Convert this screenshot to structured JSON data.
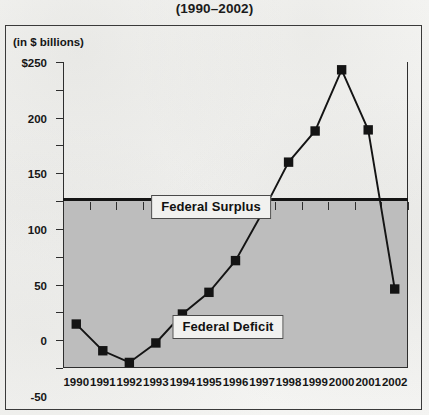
{
  "title": "(1990–2002)",
  "axis_unit_label": "(in $ billions)",
  "region_labels": {
    "surplus": "Federal Surplus",
    "deficit": "Federal Deficit"
  },
  "colors": {
    "line": "#141414",
    "marker": "#141414",
    "deficit_shading": "#bdbdbd",
    "axis": "#2e2e2e",
    "zero_line": "#141414",
    "paper_background": "#f2f2f0",
    "text": "#161616"
  },
  "chart_data": {
    "type": "line",
    "title": "(1990–2002)",
    "xlabel": "",
    "ylabel": "(in $ billions)",
    "ylim": [
      -300,
      250
    ],
    "grid": false,
    "legend": "none",
    "y_ticks": [
      250,
      200,
      150,
      100,
      50,
      0,
      -50,
      -100,
      -150,
      -200,
      -250,
      -300
    ],
    "y_tick_labels": [
      "$250",
      "200",
      "150",
      "100",
      "50",
      "0",
      "-50",
      "-100",
      "-150",
      "-200",
      "-250",
      "-300"
    ],
    "categories": [
      "1990",
      "1991",
      "1992",
      "1993",
      "1994",
      "1995",
      "1996",
      "1997",
      "1998",
      "1999",
      "2000",
      "2001",
      "2002"
    ],
    "values": [
      -221,
      -269,
      -290,
      -255,
      -203,
      -164,
      -107,
      -22,
      70,
      126,
      236,
      128,
      -158
    ],
    "annotations": [
      {
        "text": "Federal Surplus",
        "region": "above-zero"
      },
      {
        "text": "Federal Deficit",
        "region": "below-zero"
      }
    ],
    "marker": "square",
    "zero_line": 0
  }
}
